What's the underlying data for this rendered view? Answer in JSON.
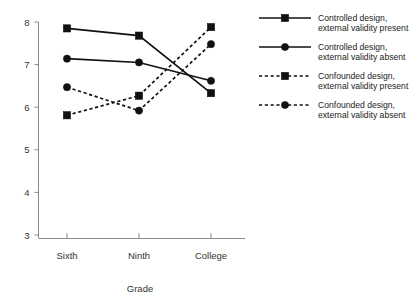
{
  "chart_data": {
    "type": "line",
    "title": "",
    "xlabel": "Grade",
    "ylabel": "",
    "categories": [
      "Sixth",
      "Ninth",
      "College"
    ],
    "ylim": [
      3,
      8
    ],
    "yticks": [
      3,
      4,
      5,
      6,
      7,
      8
    ],
    "ytick_labels": [
      "3",
      "4",
      "5",
      "6",
      "7",
      "8"
    ],
    "grid": false,
    "legend_position": "right",
    "series": [
      {
        "name": "Controlled design, external validity present",
        "name_line1": "Controlled design,",
        "name_line2": "external validity present",
        "marker": "square",
        "linestyle": "solid",
        "color": "#111111",
        "values": [
          7.85,
          7.68,
          6.33
        ]
      },
      {
        "name": "Controlled design, external validity absent",
        "name_line1": "Controlled design,",
        "name_line2": "external validity absent",
        "marker": "circle",
        "linestyle": "solid",
        "color": "#111111",
        "values": [
          7.14,
          7.05,
          6.62
        ]
      },
      {
        "name": "Confounded design, external validity present",
        "name_line1": "Confounded design,",
        "name_line2": "external validity present",
        "marker": "square",
        "linestyle": "dashed",
        "color": "#111111",
        "values": [
          5.81,
          6.27,
          7.88
        ]
      },
      {
        "name": "Confounded design, external validity absent",
        "name_line1": "Confounded design,",
        "name_line2": "external validity absent",
        "marker": "circle",
        "linestyle": "dashed",
        "color": "#111111",
        "values": [
          6.47,
          5.92,
          7.48
        ]
      }
    ]
  },
  "axis": {
    "x_title": "Grade",
    "x_tick_labels": [
      "Sixth",
      "Ninth",
      "College"
    ],
    "y_tick_labels": [
      "3",
      "4",
      "5",
      "6",
      "7",
      "8"
    ]
  },
  "legend": {
    "items": [
      {
        "line1": "Controlled design,",
        "line2": "external validity present",
        "marker": "square",
        "style": "solid"
      },
      {
        "line1": "Controlled design,",
        "line2": "external validity absent",
        "marker": "circle",
        "style": "solid"
      },
      {
        "line1": "Confounded design,",
        "line2": "external validity present",
        "marker": "square",
        "style": "dashed"
      },
      {
        "line1": "Confounded design,",
        "line2": "external validity absent",
        "marker": "circle",
        "style": "dashed"
      }
    ]
  }
}
